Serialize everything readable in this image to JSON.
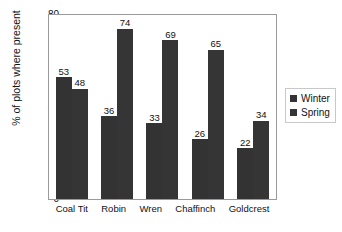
{
  "top_sliver_text": "",
  "chart_data": {
    "type": "bar",
    "title": "",
    "xlabel": "",
    "ylabel": "% of plots where present",
    "ylim": [
      0,
      80
    ],
    "ytick_step": 10,
    "yticks": [
      80,
      70,
      60,
      50,
      40,
      30,
      20,
      10,
      0
    ],
    "grid": false,
    "legend_position": "right",
    "categories": [
      "Coal Tit",
      "Robin",
      "Wren",
      "Chaffinch",
      "Goldcrest"
    ],
    "series": [
      {
        "name": "Winter",
        "color": "#333333",
        "values": [
          53,
          36,
          33,
          26,
          22
        ]
      },
      {
        "name": "Spring",
        "color": "#353535",
        "values": [
          48,
          74,
          69,
          65,
          34
        ]
      }
    ],
    "data_labels": {
      "Coal Tit": {
        "Winter": "53",
        "Spring": "48"
      },
      "Robin": {
        "Winter": "36",
        "Spring": "74"
      },
      "Wren": {
        "Winter": "33",
        "Spring": "69"
      },
      "Chaffinch": {
        "Winter": "26",
        "Spring": "65"
      },
      "Goldcrest": {
        "Winter": "22",
        "Spring": "34"
      }
    }
  },
  "legend": {
    "items": [
      {
        "label": "Winter",
        "color": "#333333"
      },
      {
        "label": "Spring",
        "color": "#353535"
      }
    ]
  }
}
